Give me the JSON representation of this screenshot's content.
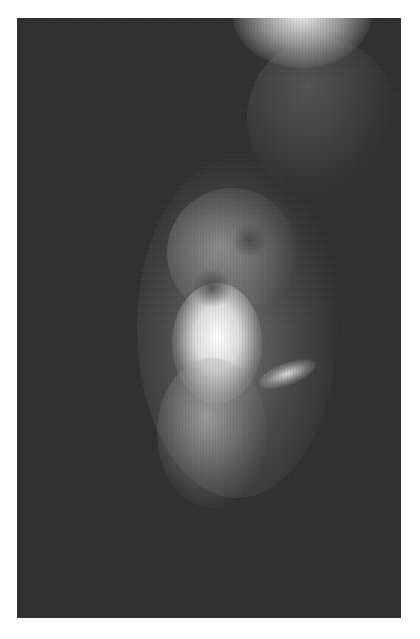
{
  "image": {
    "description": "Grayscale X-ray radiograph (mammogram-like) showing bright fibroglandular tissue in the center-left on a dark background",
    "background_color": "#2e2e2e",
    "frame_color": "#ffffff",
    "bright_tissue_color": "#f4f4f4"
  }
}
